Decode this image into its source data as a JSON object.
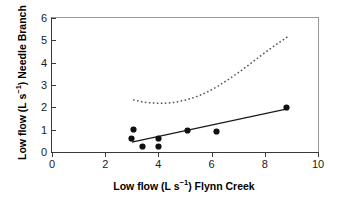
{
  "chart_data": {
    "type": "scatter",
    "title": "",
    "xlabel": "Low flow (L s−1) Flynn Creek",
    "xlabel_parts": {
      "pre": "Low flow (L s",
      "sup": "−1",
      "post": ") Flynn Creek"
    },
    "ylabel": "Low flow (L s−1) Needle Branch",
    "ylabel_parts": {
      "pre": "Low flow (L s",
      "sup": "−1",
      "post": ") Needle Branch"
    },
    "xlim": [
      0,
      10
    ],
    "ylim": [
      0,
      6
    ],
    "xticks": [
      0,
      2,
      4,
      6,
      8,
      10
    ],
    "yticks": [
      0,
      1,
      2,
      3,
      4,
      5,
      6
    ],
    "xticklabels": [
      "0",
      "2",
      "4",
      "6",
      "8",
      "10"
    ],
    "yticklabels": [
      "0",
      "1",
      "2",
      "3",
      "4",
      "5",
      "6"
    ],
    "grid": false,
    "legend": "none",
    "marker": "filled-diamond",
    "marker_color": "#111111",
    "points": [
      {
        "x": 3.0,
        "y": 0.6
      },
      {
        "x": 3.05,
        "y": 1.0
      },
      {
        "x": 3.4,
        "y": 0.25
      },
      {
        "x": 4.0,
        "y": 0.62
      },
      {
        "x": 4.0,
        "y": 0.25
      },
      {
        "x": 5.1,
        "y": 0.97
      },
      {
        "x": 6.2,
        "y": 0.9
      },
      {
        "x": 8.8,
        "y": 2.0
      }
    ],
    "series": [
      {
        "name": "regression line",
        "style": "solid",
        "color": "#1a1a1a",
        "x": [
          3.0,
          8.8
        ],
        "values": [
          0.44,
          1.92
        ]
      },
      {
        "name": "confidence curve",
        "style": "dotted",
        "color": "#555555",
        "x": [
          3.05,
          3.4,
          3.8,
          4.2,
          4.6,
          5.0,
          5.4,
          5.8,
          6.2,
          6.6,
          7.0,
          7.4,
          7.8,
          8.2,
          8.6,
          8.85
        ],
        "values": [
          2.34,
          2.24,
          2.19,
          2.18,
          2.22,
          2.32,
          2.46,
          2.66,
          2.92,
          3.22,
          3.55,
          3.9,
          4.27,
          4.62,
          4.95,
          5.15
        ]
      }
    ]
  }
}
